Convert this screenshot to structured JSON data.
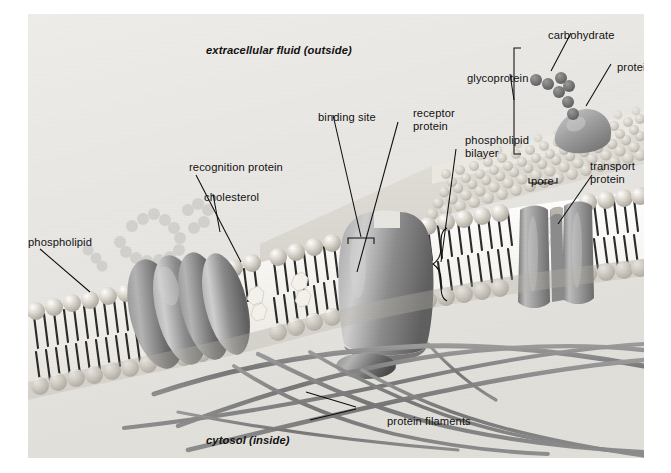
{
  "figure": {
    "compartments": {
      "outside": "extracellular fluid (outside)",
      "inside": "cytosol (inside)"
    },
    "labels": {
      "phospholipid": "phospholipid",
      "recognition_protein": "recognition protein",
      "cholesterol": "cholesterol",
      "binding_site": "binding site",
      "receptor_protein_l1": "receptor",
      "receptor_protein_l2": "protein",
      "phospholipid_bilayer_l1": "phospholipid",
      "phospholipid_bilayer_l2": "bilayer",
      "glycoprotein": "glycoprotein",
      "carbohydrate": "carbohydrate",
      "protein": "protein",
      "pore": "pore",
      "transport_protein_l1": "transport",
      "transport_protein_l2": "protein",
      "protein_filaments": "protein filaments"
    },
    "colors": {
      "background": "#eceae6",
      "page": "#ffffff",
      "head_group": "#d9d6cf",
      "tail": "#2c2c2c",
      "protein_body": "#8e8e8e",
      "protein_dark": "#6a6a6a",
      "cholesterol": "#f2f0e8",
      "filament": "#7f7f7f",
      "leader_line": "#0d0d0d",
      "text": "#101010"
    },
    "structures": [
      "phospholipid bilayer",
      "cholesterol",
      "recognition protein",
      "receptor protein with binding site",
      "glycoprotein with carbohydrate chain",
      "transport protein with pore",
      "protein filaments (cytoskeleton)"
    ]
  }
}
